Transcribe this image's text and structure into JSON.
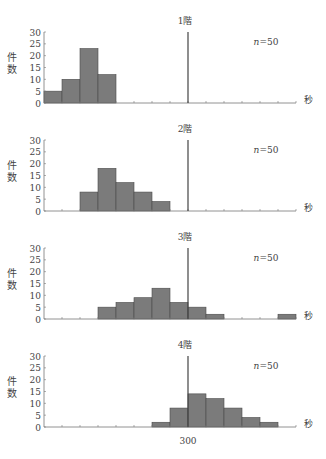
{
  "chart_data": [
    {
      "type": "bar",
      "title": "1階",
      "annotation": "n=50",
      "xlabel": "秒",
      "ylabel": "件数",
      "ylim": [
        0,
        30
      ],
      "yticks": [
        0,
        5,
        10,
        15,
        20,
        25,
        30
      ],
      "bin_count": 14,
      "reference_line_bin": 8,
      "values": [
        5,
        10,
        23,
        12,
        0,
        0,
        0,
        0,
        0,
        0,
        0,
        0,
        0,
        0
      ]
    },
    {
      "type": "bar",
      "title": "2階",
      "annotation": "n=50",
      "xlabel": "秒",
      "ylabel": "件数",
      "ylim": [
        0,
        30
      ],
      "yticks": [
        0,
        5,
        10,
        15,
        20,
        25,
        30
      ],
      "bin_count": 14,
      "reference_line_bin": 8,
      "values": [
        0,
        0,
        8,
        18,
        12,
        8,
        4,
        0,
        0,
        0,
        0,
        0,
        0,
        0
      ]
    },
    {
      "type": "bar",
      "title": "3階",
      "annotation": "n=50",
      "xlabel": "秒",
      "ylabel": "件数",
      "ylim": [
        0,
        30
      ],
      "yticks": [
        0,
        5,
        10,
        15,
        20,
        25,
        30
      ],
      "bin_count": 14,
      "reference_line_bin": 8,
      "values": [
        0,
        0,
        0,
        5,
        7,
        9,
        13,
        7,
        5,
        2,
        0,
        0,
        0,
        2
      ]
    },
    {
      "type": "bar",
      "title": "4階",
      "annotation": "n=50",
      "xlabel": "秒",
      "ylabel": "件数",
      "ylim": [
        0,
        30
      ],
      "yticks": [
        0,
        5,
        10,
        15,
        20,
        25,
        30
      ],
      "bin_count": 14,
      "reference_line_bin": 8,
      "reference_line_label": "300",
      "values": [
        0,
        0,
        0,
        0,
        0,
        0,
        2,
        8,
        14,
        12,
        8,
        4,
        2,
        0
      ]
    }
  ],
  "colors": {
    "bar_fill": "#7b7b7b",
    "bar_stroke": "#4a4a4a",
    "axis": "#777777",
    "reference_line": "#444444"
  }
}
